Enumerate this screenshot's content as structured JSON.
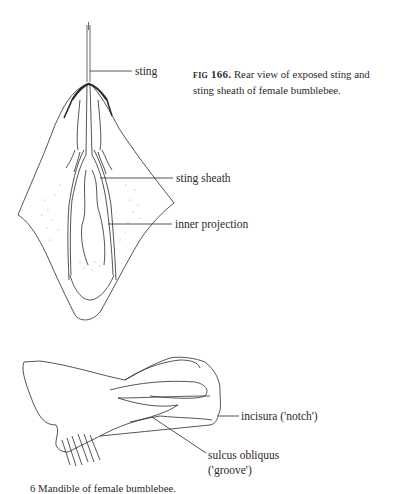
{
  "figure_166": {
    "caption_number": "fig 166.",
    "caption_text": " Rear view of exposed sting and sting sheath of female bumblebee.",
    "labels": {
      "sting": "sting",
      "sting_sheath": "sting sheath",
      "inner_projection": "inner projection"
    }
  },
  "figure_167": {
    "labels": {
      "incisura": "incisura ('notch')",
      "sulcus_line1": "sulcus obliquus",
      "sulcus_line2": "('groove')"
    },
    "caption_text_partial": "6  Mandible of female bumblebee."
  },
  "colors": {
    "ink": "#2a2a2a",
    "stipple": "#8a8a8a",
    "background": "#ffffff"
  }
}
